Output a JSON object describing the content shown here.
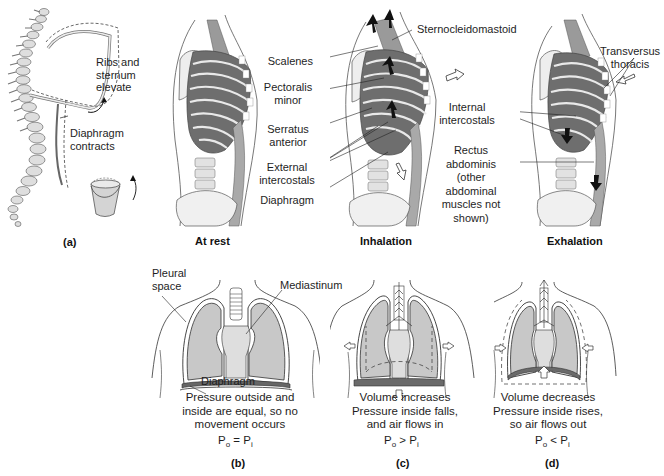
{
  "figure": {
    "panels": {
      "a": {
        "letter": "(a)",
        "labels": {
          "ribs": "Ribs and\nsternum\nelevate",
          "ribs_lines": [
            "Ribs and",
            "sternum",
            "elevate"
          ],
          "diaphragm_lines": [
            "Diaphragm",
            "contracts"
          ]
        },
        "icons": [
          "spine-icon",
          "rib-cage-outline-icon",
          "bucket-handle-icon",
          "curved-arrow-icon"
        ]
      },
      "at_rest": {
        "title": "At rest"
      },
      "inhalation": {
        "title": "Inhalation",
        "muscles": [
          {
            "lines": [
              "Sternocleidomastoid"
            ]
          },
          {
            "lines": [
              "Scalenes"
            ]
          },
          {
            "lines": [
              "Pectoralis",
              "minor"
            ]
          },
          {
            "lines": [
              "Serratus",
              "anterior"
            ]
          },
          {
            "lines": [
              "External",
              "intercostals"
            ]
          },
          {
            "lines": [
              "Diaphragm"
            ]
          }
        ]
      },
      "exhalation": {
        "title": "Exhalation",
        "muscles": [
          {
            "lines": [
              "Transversus",
              "thoracis"
            ]
          },
          {
            "lines": [
              "Internal",
              "intercostals"
            ]
          },
          {
            "lines": [
              "Rectus",
              "abdominis",
              "(other",
              "abdominal",
              "muscles not",
              "shown)"
            ]
          }
        ]
      },
      "b": {
        "letter": "(b)",
        "labels": {
          "pleural_lines": [
            "Pleural",
            "space"
          ],
          "mediastinum": "Mediastinum",
          "diaphragm": "Diaphragm"
        },
        "caption_lines": [
          "Pressure outside and",
          "inside are equal, so no",
          "movement occurs"
        ],
        "equation": {
          "left": "P",
          "left_sub": "o",
          "op": " = ",
          "right": "P",
          "right_sub": "i"
        }
      },
      "c": {
        "letter": "(c)",
        "caption_lines": [
          "Volume increases",
          "Pressure inside falls,",
          "and air flows in"
        ],
        "equation": {
          "left": "P",
          "left_sub": "o",
          "op": " > ",
          "right": "P",
          "right_sub": "i"
        }
      },
      "d": {
        "letter": "(d)",
        "caption_lines": [
          "Volume decreases",
          "Pressure inside rises,",
          "so air flows out"
        ],
        "equation": {
          "left": "P",
          "left_sub": "o",
          "op": " < ",
          "right": "P",
          "right_sub": "i"
        }
      }
    },
    "colors": {
      "lung_fill": "#c8c8c8",
      "mediastinum_fill": "#dcdcdc",
      "line": "#2a2a2a",
      "muscle_dark": "#5a5a5a",
      "muscle_mid": "#8c8c8c",
      "bone": "#e6e6e6",
      "arrow_black": "#111111"
    }
  }
}
